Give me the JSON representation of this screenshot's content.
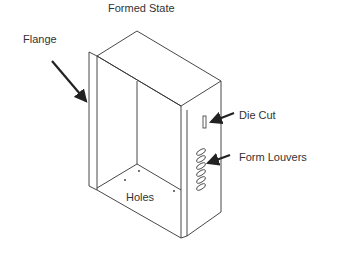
{
  "diagram": {
    "title": "Formed State",
    "labels": {
      "flange": "Flange",
      "die_cut": "Die Cut",
      "form_louvers": "Form Louvers",
      "holes": "Holes"
    },
    "louver_count": 6,
    "colors": {
      "line": "#333333",
      "arrow": "#222222",
      "background": "#ffffff"
    }
  }
}
